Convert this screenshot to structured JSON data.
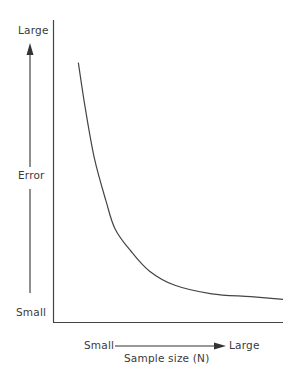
{
  "chart_data": {
    "type": "line",
    "title": "",
    "xlabel": "Sample size (N)",
    "ylabel": "Error",
    "x_axis": {
      "low_label": "Small",
      "high_label": "Large",
      "direction": "increasing-right"
    },
    "y_axis": {
      "low_label": "Small",
      "high_label": "Large",
      "direction": "increasing-up"
    },
    "grid": false,
    "legend": null,
    "series": [
      {
        "name": "Error vs sample size",
        "description": "Error decreases rapidly then levels off as sample size increases (inverse relationship)",
        "x": [
          0.11,
          0.14,
          0.18,
          0.23,
          0.27,
          0.34,
          0.42,
          0.53,
          0.69,
          0.86,
          1.0
        ],
        "y": [
          0.92,
          0.76,
          0.58,
          0.43,
          0.33,
          0.25,
          0.18,
          0.13,
          0.1,
          0.09,
          0.08
        ]
      }
    ],
    "xlim": [
      0,
      1
    ],
    "ylim": [
      0,
      1
    ]
  },
  "labels": {
    "y_high": "Large",
    "y_title": "Error",
    "y_low": "Small",
    "x_low": "Small",
    "x_high": "Large",
    "x_title": "Sample size (N)"
  }
}
